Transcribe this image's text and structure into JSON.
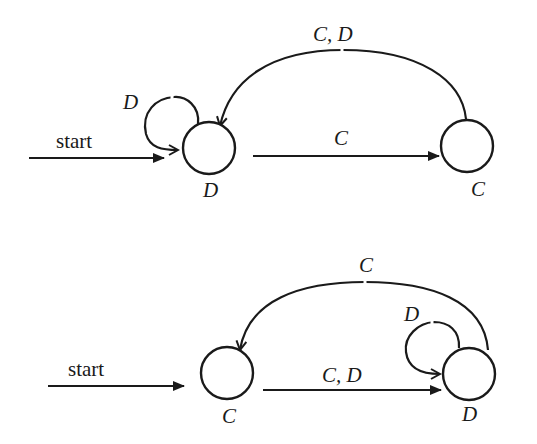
{
  "diagram": {
    "type": "finite-state-automata",
    "automata": [
      {
        "id": "top",
        "start_label": "start",
        "states": [
          {
            "id": "s1",
            "label": "D",
            "start": true
          },
          {
            "id": "s2",
            "label": "C"
          }
        ],
        "transitions": [
          {
            "from": "s1",
            "to": "s1",
            "label": "D"
          },
          {
            "from": "s1",
            "to": "s2",
            "label": "C"
          },
          {
            "from": "s2",
            "to": "s1",
            "label": "C, D"
          }
        ]
      },
      {
        "id": "bottom",
        "start_label": "start",
        "states": [
          {
            "id": "s1",
            "label": "C",
            "start": true
          },
          {
            "id": "s2",
            "label": "D"
          }
        ],
        "transitions": [
          {
            "from": "s1",
            "to": "s2",
            "label": "C, D"
          },
          {
            "from": "s2",
            "to": "s2",
            "label": "D"
          },
          {
            "from": "s2",
            "to": "s1",
            "label": "C"
          }
        ]
      }
    ]
  }
}
